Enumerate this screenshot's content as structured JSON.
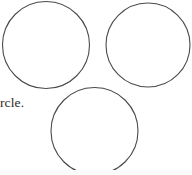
{
  "page": {
    "width": 192,
    "height": 174,
    "background_color": "#ffffff"
  },
  "text_fragment": {
    "content": "rcle.",
    "note": "truncated word at left crop edge",
    "color": "#2b2b2b"
  },
  "figure": {
    "stroke_color": "#4a4a4a",
    "fill_color": "#ffffff",
    "stroke_width": 1.1,
    "shape_type": "circle",
    "count": 3,
    "circles": [
      {
        "name": "top-left-circle",
        "cx": 46,
        "cy": 45,
        "r": 43.5
      },
      {
        "name": "top-right-circle",
        "cx": 148,
        "cy": 45,
        "r": 42
      },
      {
        "name": "bottom-center-circle",
        "cx": 94.5,
        "cy": 131,
        "r": 43.5
      }
    ]
  },
  "bottom_band": {
    "color": "#fafafa"
  }
}
